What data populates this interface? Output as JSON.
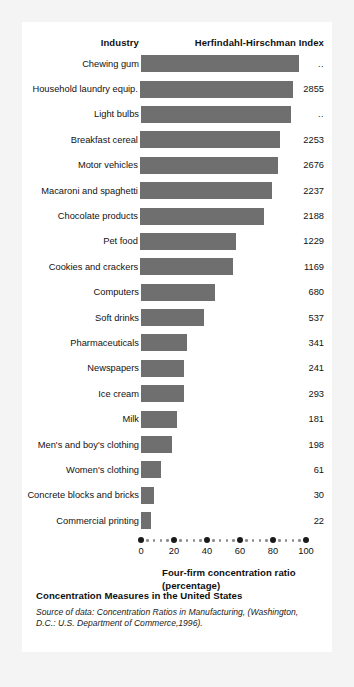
{
  "card": {
    "header": {
      "industry_label": "Industry",
      "hhi_label": "Herfindahl-Hirschman Index"
    },
    "axis_title_line1": "Four-firm concentration ratio",
    "axis_title_line2": "(percentage)",
    "footer_title": "Concentration Measures in the United States",
    "footer_source": "Source of data: Concentration Ratios in Manufacturing, (Washington, D.C.: U.S. Department of Commerce,1996)."
  },
  "colors": {
    "bar": "#6f6f6f",
    "card_background": "#ffffff",
    "page_background": "#f4f4f4",
    "text": "#121212",
    "tick_major": "#1a1a1a",
    "tick_minor": "#8c8c8c"
  },
  "chart_data": {
    "type": "bar",
    "orientation": "horizontal",
    "title": "Concentration Measures in the United States",
    "xlabel": "Four-firm concentration ratio (percentage)",
    "ylabel": "Industry",
    "xlim": [
      0,
      100
    ],
    "xticks": [
      0,
      20,
      40,
      60,
      80,
      100
    ],
    "xtick_labels": [
      "0",
      "20",
      "40",
      "60",
      "80",
      "100"
    ],
    "minor_ticks_between": 4,
    "grid": false,
    "legend": null,
    "value_column_header": "Herfindahl-Hirschman Index",
    "categories": [
      "Chewing gum",
      "Household laundry equip.",
      "Light bulbs",
      "Breakfast cereal",
      "Motor vehicles",
      "Macaroni and spaghetti",
      "Chocolate products",
      "Pet food",
      "Cookies and crackers",
      "Computers",
      "Soft drinks",
      "Pharmaceuticals",
      "Newspapers",
      "Ice cream",
      "Milk",
      "Men's and boy's clothing",
      "Women's clothing",
      "Concrete blocks and bricks",
      "Commercial printing"
    ],
    "values": [
      96,
      93,
      91,
      85,
      84,
      80,
      75,
      58,
      56,
      45,
      38,
      28,
      26,
      26,
      22,
      19,
      12,
      8,
      6
    ],
    "value_labels": [
      "..",
      "2855",
      "..",
      "2253",
      "2676",
      "2237",
      "2188",
      "1229",
      "1169",
      "680",
      "537",
      "341",
      "241",
      "293",
      "181",
      "198",
      "61",
      "30",
      "22"
    ],
    "hhi": [
      null,
      2855,
      null,
      2253,
      2676,
      2237,
      2188,
      1229,
      1169,
      680,
      537,
      341,
      241,
      293,
      181,
      198,
      61,
      30,
      22
    ],
    "rows": [
      {
        "category": "Chewing gum",
        "ratio": 96,
        "hhi_label": ".."
      },
      {
        "category": "Household laundry equip.",
        "ratio": 93,
        "hhi_label": "2855"
      },
      {
        "category": "Light bulbs",
        "ratio": 91,
        "hhi_label": ".."
      },
      {
        "category": "Breakfast cereal",
        "ratio": 85,
        "hhi_label": "2253"
      },
      {
        "category": "Motor vehicles",
        "ratio": 84,
        "hhi_label": "2676"
      },
      {
        "category": "Macaroni and spaghetti",
        "ratio": 80,
        "hhi_label": "2237"
      },
      {
        "category": "Chocolate products",
        "ratio": 75,
        "hhi_label": "2188"
      },
      {
        "category": "Pet food",
        "ratio": 58,
        "hhi_label": "1229"
      },
      {
        "category": "Cookies and crackers",
        "ratio": 56,
        "hhi_label": "1169"
      },
      {
        "category": "Computers",
        "ratio": 45,
        "hhi_label": "680"
      },
      {
        "category": "Soft drinks",
        "ratio": 38,
        "hhi_label": "537"
      },
      {
        "category": "Pharmaceuticals",
        "ratio": 28,
        "hhi_label": "341"
      },
      {
        "category": "Newspapers",
        "ratio": 26,
        "hhi_label": "241"
      },
      {
        "category": "Ice cream",
        "ratio": 26,
        "hhi_label": "293"
      },
      {
        "category": "Milk",
        "ratio": 22,
        "hhi_label": "181"
      },
      {
        "category": "Men's and boy's clothing",
        "ratio": 19,
        "hhi_label": "198"
      },
      {
        "category": "Women's clothing",
        "ratio": 12,
        "hhi_label": "61"
      },
      {
        "category": "Concrete blocks and bricks",
        "ratio": 8,
        "hhi_label": "30"
      },
      {
        "category": "Commercial printing",
        "ratio": 6,
        "hhi_label": "22"
      }
    ]
  }
}
